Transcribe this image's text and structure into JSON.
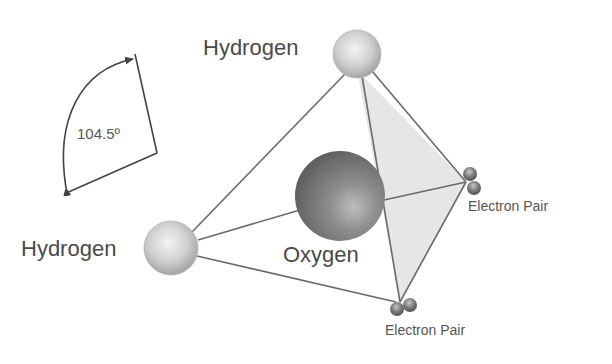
{
  "diagram": {
    "labels": {
      "hydrogen_top": "Hydrogen",
      "hydrogen_left": "Hydrogen",
      "oxygen": "Oxygen",
      "electron_pair_right": "Electron Pair",
      "electron_pair_bottom": "Electron Pair",
      "bond_angle": "104.5º"
    },
    "atoms": [
      {
        "id": "hydrogen_top",
        "x": 357,
        "y": 54,
        "r": 24
      },
      {
        "id": "hydrogen_left",
        "x": 171,
        "y": 248,
        "r": 27
      },
      {
        "id": "oxygen",
        "x": 340,
        "y": 196,
        "r": 45
      }
    ],
    "electron_pairs": [
      {
        "id": "electron_pair_right",
        "x": 467,
        "y": 183
      },
      {
        "id": "electron_pair_bottom",
        "x": 400,
        "y": 306
      }
    ],
    "colors": {
      "line": "#6a6a6a",
      "shaded_face": "#e6e6e6",
      "text": "#4a4a4a",
      "background": "#ffffff"
    }
  }
}
